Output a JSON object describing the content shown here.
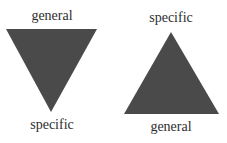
{
  "diagram": {
    "fill_color": "#4a4a4a",
    "left": {
      "shape": "inverted-triangle",
      "top_label": "general",
      "bottom_label": "specific"
    },
    "right": {
      "shape": "upright-triangle",
      "top_label": "specific",
      "bottom_label": "general"
    }
  }
}
